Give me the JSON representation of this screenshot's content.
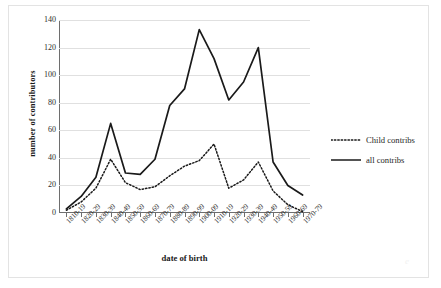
{
  "figure": {
    "watermark": "e"
  },
  "chart_data": {
    "type": "line",
    "title": "",
    "xlabel": "date of birth",
    "ylabel": "number of contributors",
    "ylim": [
      0,
      140
    ],
    "yticks": [
      0,
      20,
      40,
      60,
      80,
      100,
      120,
      140
    ],
    "grid": true,
    "legend_position": "right",
    "categories": [
      "1810-19",
      "1820-29",
      "1830-39",
      "1840-49",
      "1850-59",
      "1860-69",
      "1870-79",
      "1880-89",
      "1890-99",
      "1900-09",
      "1910-19",
      "1920-29",
      "1930-39",
      "1940-49",
      "1950-59",
      "1960-69",
      "1970-79"
    ],
    "series": [
      {
        "name": "Child contribs",
        "style": "dotted",
        "color": "#1a1a1a",
        "values": [
          2,
          8,
          18,
          39,
          22,
          17,
          19,
          27,
          34,
          38,
          50,
          18,
          24,
          37,
          16,
          6,
          1
        ]
      },
      {
        "name": "all contribs",
        "style": "solid",
        "color": "#1a1a1a",
        "values": [
          3,
          12,
          26,
          65,
          29,
          28,
          39,
          78,
          90,
          133,
          112,
          82,
          95,
          120,
          37,
          20,
          13
        ]
      }
    ]
  }
}
